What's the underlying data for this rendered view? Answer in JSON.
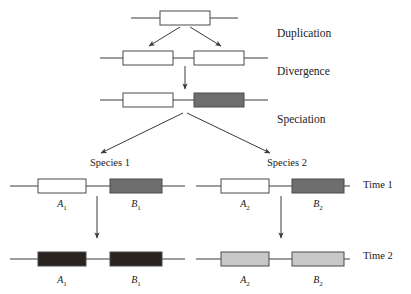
{
  "figure": {
    "background": "#ffffff",
    "width": 411,
    "height": 294
  },
  "colors": {
    "white_gene": "#ffffff",
    "dark_gray_gene": "#6e6e6e",
    "black_gene": "#2a2320",
    "light_gray_gene": "#c8c8c8",
    "outline": "#4a4a4a",
    "line": "#3a3a3a",
    "text": "#1a1a1a"
  },
  "stage_labels": [
    {
      "id": "duplication",
      "text": "Duplication",
      "x": 277,
      "y": 37
    },
    {
      "id": "divergence",
      "text": "Divergence",
      "x": 277,
      "y": 75
    },
    {
      "id": "speciation",
      "text": "Speciation",
      "x": 277,
      "y": 123
    }
  ],
  "species_labels": [
    {
      "id": "species-1",
      "text": "Species 1",
      "x": 110,
      "y": 166
    },
    {
      "id": "species-2",
      "text": "Species 2",
      "x": 287,
      "y": 166
    }
  ],
  "time_labels": [
    {
      "id": "time-1",
      "text": "Time 1",
      "x": 363,
      "y": 188
    },
    {
      "id": "time-2",
      "text": "Time 2",
      "x": 363,
      "y": 259
    }
  ],
  "gene_labels": [
    {
      "id": "a1-time1",
      "base": "A",
      "sub": "1",
      "x": 62,
      "y": 207
    },
    {
      "id": "b1-time1",
      "base": "B",
      "sub": "1",
      "x": 136,
      "y": 207
    },
    {
      "id": "a2-time1",
      "base": "A",
      "sub": "2",
      "x": 245,
      "y": 207
    },
    {
      "id": "b2-time1",
      "base": "B",
      "sub": "2",
      "x": 318,
      "y": 207
    },
    {
      "id": "a1-time2",
      "base": "A",
      "sub": "1",
      "x": 62,
      "y": 283
    },
    {
      "id": "b1-time2",
      "base": "B",
      "sub": "1",
      "x": 136,
      "y": 283
    },
    {
      "id": "a2-time2",
      "base": "A",
      "sub": "2",
      "x": 245,
      "y": 283
    },
    {
      "id": "b2-time2",
      "base": "B",
      "sub": "2",
      "x": 318,
      "y": 283
    }
  ],
  "chromosomes": [
    {
      "id": "ancestral-single-gene",
      "line": {
        "x1": 131,
        "y1": 18,
        "x2": 238,
        "y2": 18
      },
      "genes": [
        {
          "id": "ancestral-gene",
          "x": 160,
          "y": 11,
          "w": 50,
          "h": 14,
          "fill": "#ffffff"
        }
      ]
    },
    {
      "id": "duplicated-chromosome",
      "line": {
        "x1": 100,
        "y1": 58,
        "x2": 268,
        "y2": 58
      },
      "genes": [
        {
          "id": "duplicate-gene-left",
          "x": 123,
          "y": 51,
          "w": 50,
          "h": 14,
          "fill": "#ffffff"
        },
        {
          "id": "duplicate-gene-right",
          "x": 194,
          "y": 51,
          "w": 50,
          "h": 14,
          "fill": "#ffffff"
        }
      ]
    },
    {
      "id": "diverged-chromosome",
      "line": {
        "x1": 100,
        "y1": 100,
        "x2": 268,
        "y2": 100
      },
      "genes": [
        {
          "id": "diverged-gene-a",
          "x": 123,
          "y": 93,
          "w": 50,
          "h": 14,
          "fill": "#ffffff"
        },
        {
          "id": "diverged-gene-b",
          "x": 194,
          "y": 93,
          "w": 50,
          "h": 14,
          "fill": "#6e6e6e"
        }
      ]
    },
    {
      "id": "species1-time1-chromosome",
      "line": {
        "x1": 10,
        "y1": 186,
        "x2": 185,
        "y2": 186
      },
      "genes": [
        {
          "id": "species1-time1-gene-a1",
          "x": 38,
          "y": 179,
          "w": 48,
          "h": 14,
          "fill": "#ffffff"
        },
        {
          "id": "species1-time1-gene-b1",
          "x": 110,
          "y": 179,
          "w": 52,
          "h": 14,
          "fill": "#6e6e6e"
        }
      ]
    },
    {
      "id": "species2-time1-chromosome",
      "line": {
        "x1": 196,
        "y1": 186,
        "x2": 350,
        "y2": 186
      },
      "genes": [
        {
          "id": "species2-time1-gene-a2",
          "x": 221,
          "y": 179,
          "w": 48,
          "h": 14,
          "fill": "#ffffff"
        },
        {
          "id": "species2-time1-gene-b2",
          "x": 292,
          "y": 179,
          "w": 52,
          "h": 14,
          "fill": "#6e6e6e"
        }
      ]
    },
    {
      "id": "species1-time2-chromosome",
      "line": {
        "x1": 10,
        "y1": 259,
        "x2": 185,
        "y2": 259
      },
      "genes": [
        {
          "id": "species1-time2-gene-a1",
          "x": 38,
          "y": 252,
          "w": 48,
          "h": 14,
          "fill": "#2a2320"
        },
        {
          "id": "species1-time2-gene-b1",
          "x": 110,
          "y": 252,
          "w": 52,
          "h": 14,
          "fill": "#2a2320"
        }
      ]
    },
    {
      "id": "species2-time2-chromosome",
      "line": {
        "x1": 196,
        "y1": 259,
        "x2": 350,
        "y2": 259
      },
      "genes": [
        {
          "id": "species2-time2-gene-a2",
          "x": 221,
          "y": 252,
          "w": 48,
          "h": 14,
          "fill": "#c8c8c8"
        },
        {
          "id": "species2-time2-gene-b2",
          "x": 292,
          "y": 252,
          "w": 52,
          "h": 14,
          "fill": "#c8c8c8"
        }
      ]
    }
  ],
  "arrows": [
    {
      "id": "duplication-arrow-left",
      "x1": 180,
      "y1": 27,
      "x2": 149,
      "y2": 46
    },
    {
      "id": "duplication-arrow-right",
      "x1": 190,
      "y1": 27,
      "x2": 221,
      "y2": 46
    },
    {
      "id": "divergence-arrow",
      "x1": 185,
      "y1": 66,
      "x2": 185,
      "y2": 89
    },
    {
      "id": "speciation-arrow-left",
      "x1": 183,
      "y1": 113,
      "x2": 101,
      "y2": 153
    },
    {
      "id": "speciation-arrow-right",
      "x1": 187,
      "y1": 113,
      "x2": 270,
      "y2": 153
    },
    {
      "id": "species1-time-arrow",
      "x1": 97,
      "y1": 196,
      "x2": 97,
      "y2": 238
    },
    {
      "id": "species2-time-arrow",
      "x1": 281,
      "y1": 196,
      "x2": 281,
      "y2": 238
    }
  ]
}
